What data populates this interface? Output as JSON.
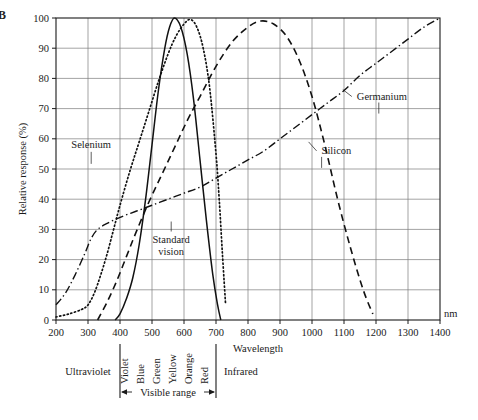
{
  "figure": {
    "panel_label": "B"
  },
  "chart_data": {
    "type": "line",
    "title": "",
    "xlabel": "Wavelength",
    "xunit": "nm",
    "ylabel": "Relative response (%)",
    "xlim": [
      200,
      1400
    ],
    "ylim": [
      0,
      100
    ],
    "grid": true,
    "legend_position": "inline-annotations",
    "xticks": [
      200,
      300,
      400,
      500,
      600,
      700,
      800,
      900,
      1000,
      1100,
      1200,
      1300,
      1400
    ],
    "yticks": [
      0,
      10,
      20,
      30,
      40,
      50,
      60,
      70,
      80,
      90,
      100
    ],
    "series": [
      {
        "name": "Selenium",
        "style": "dotted",
        "x": [
          200,
          240,
          280,
          300,
          320,
          340,
          360,
          380,
          400,
          430,
          460,
          490,
          520,
          550,
          575,
          600,
          620,
          640,
          660,
          680,
          700,
          710,
          720,
          730
        ],
        "y": [
          1,
          2,
          3.5,
          5,
          9,
          15,
          22,
          30,
          38,
          49,
          59,
          69,
          79,
          88,
          94,
          98,
          99.5,
          97,
          90,
          77,
          55,
          40,
          22,
          5
        ]
      },
      {
        "name": "Standard vision",
        "style": "solid",
        "x": [
          385,
          400,
          420,
          440,
          460,
          480,
          500,
          520,
          540,
          555,
          570,
          590,
          610,
          630,
          650,
          670,
          690,
          705,
          715
        ],
        "y": [
          0,
          2,
          7,
          14,
          25,
          40,
          58,
          76,
          90,
          97,
          100,
          97,
          88,
          73,
          53,
          33,
          15,
          5,
          0
        ]
      },
      {
        "name": "Silicon",
        "style": "dashed",
        "x": [
          330,
          360,
          390,
          420,
          450,
          490,
          530,
          570,
          610,
          650,
          700,
          750,
          800,
          840,
          880,
          920,
          960,
          1000,
          1040,
          1080,
          1120,
          1160,
          1190
        ],
        "y": [
          0,
          6,
          13,
          21,
          29,
          39,
          48,
          57,
          66,
          74,
          84,
          92,
          97,
          99,
          98,
          94,
          86,
          74,
          58,
          40,
          24,
          10,
          2
        ]
      },
      {
        "name": "Germanium",
        "style": "dashdot",
        "x": [
          200,
          230,
          260,
          290,
          310,
          330,
          360,
          400,
          450,
          500,
          550,
          600,
          650,
          700,
          750,
          800,
          850,
          900,
          950,
          1000,
          1050,
          1100,
          1150,
          1200,
          1250,
          1300,
          1350,
          1400
        ],
        "y": [
          5,
          9,
          15,
          22,
          27,
          30,
          32,
          34,
          36,
          38,
          40,
          42,
          44,
          47,
          50,
          53,
          56,
          60,
          64,
          68,
          72,
          76,
          81,
          85,
          89,
          93,
          97,
          100
        ]
      }
    ],
    "annotations": [
      {
        "label": "Selenium",
        "x": 310,
        "y": 57
      },
      {
        "label": "Standard vision",
        "x": 560,
        "y": 24
      },
      {
        "label": "Silicon",
        "x": 1030,
        "y": 55
      },
      {
        "label": "Germanium",
        "x": 1140,
        "y": 73
      }
    ],
    "spectrum_bands": [
      {
        "label": "Ultraviolet",
        "from": 200,
        "to": 400
      },
      {
        "label": "Visible range",
        "from": 400,
        "to": 700
      },
      {
        "label": "Infrared",
        "from": 700,
        "to": 1400
      }
    ],
    "visible_colors": [
      "Violet",
      "Blue",
      "Green",
      "Yellow",
      "Orange",
      "Red"
    ]
  }
}
